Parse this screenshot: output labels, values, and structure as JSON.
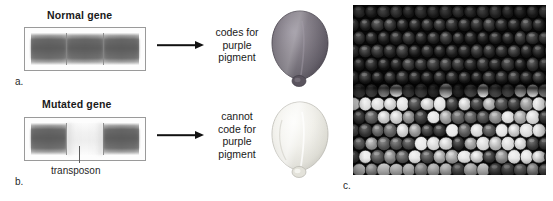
{
  "figure": {
    "panels": [
      {
        "key": "normal",
        "title": "Normal gene",
        "item_label": "a.",
        "caption": "codes for\npurple\npigment",
        "kernel_name": "purple-kernel",
        "kernel_color": "#6f6a70",
        "segments": [
          "dark",
          "dark",
          "dark"
        ]
      },
      {
        "key": "mutated",
        "title": "Mutated gene",
        "item_label": "b.",
        "caption": "cannot\ncode for\npurple\npigment",
        "kernel_name": "pale-kernel",
        "kernel_color": "#e2e0da",
        "segments": [
          "dark",
          "light",
          "dark"
        ],
        "annotation": "transposon"
      }
    ],
    "photo": {
      "item_label": "c.",
      "description": "corn-cob-variegated-kernels",
      "top_band": "solid dark purple kernels",
      "bottom_band": "variegated spotted kernels"
    },
    "colors": {
      "ink": "#1a1a1a",
      "arrow": "#111111",
      "gel_border": "#9a9a9a",
      "band_dark": "#737373",
      "band_light": "#f0f0f0"
    }
  }
}
